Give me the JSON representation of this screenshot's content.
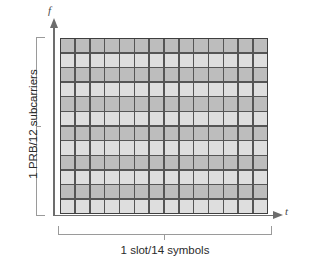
{
  "figure": {
    "type": "resource-grid-diagram",
    "background_color": "#ffffff"
  },
  "axes": {
    "vertical": {
      "label": "f",
      "name": "frequency-axis",
      "color": "#6d6d6d",
      "has_arrow": true
    },
    "horizontal": {
      "label": "t",
      "name": "time-axis",
      "color": "#6d6d6d",
      "has_arrow": true
    }
  },
  "annotations": {
    "y_bracket_label": "1 PRB/12 subcarriers",
    "x_bracket_label": "1 slot/14 symbols",
    "bracket_color": "#9a9a9a"
  },
  "chart_data": {
    "type": "heatmap",
    "title": "",
    "xlabel": "1 slot/14 symbols",
    "ylabel": "1 PRB/12 subcarriers",
    "columns": 14,
    "rows": 12,
    "column_labels": [
      "0",
      "1",
      "2",
      "3",
      "4",
      "5",
      "6",
      "7",
      "8",
      "9",
      "10",
      "11",
      "12",
      "13"
    ],
    "row_labels": [
      "11",
      "10",
      "9",
      "8",
      "7",
      "6",
      "5",
      "4",
      "3",
      "2",
      "1",
      "0"
    ],
    "grid": true,
    "legend": "none",
    "cell_shades": [
      "dark",
      "light",
      "dark",
      "light",
      "dark",
      "light",
      "dark",
      "light",
      "dark",
      "light",
      "dark",
      "light"
    ],
    "colors": {
      "shade_dark": "#bdbdbd",
      "shade_light": "#dedede",
      "gridline": "#555555",
      "border": "#3f3f3f"
    },
    "values": [
      [
        1,
        1,
        1,
        1,
        1,
        1,
        1,
        1,
        1,
        1,
        1,
        1,
        1,
        1
      ],
      [
        0,
        0,
        0,
        0,
        0,
        0,
        0,
        0,
        0,
        0,
        0,
        0,
        0,
        0
      ],
      [
        1,
        1,
        1,
        1,
        1,
        1,
        1,
        1,
        1,
        1,
        1,
        1,
        1,
        1
      ],
      [
        0,
        0,
        0,
        0,
        0,
        0,
        0,
        0,
        0,
        0,
        0,
        0,
        0,
        0
      ],
      [
        1,
        1,
        1,
        1,
        1,
        1,
        1,
        1,
        1,
        1,
        1,
        1,
        1,
        1
      ],
      [
        0,
        0,
        0,
        0,
        0,
        0,
        0,
        0,
        0,
        0,
        0,
        0,
        0,
        0
      ],
      [
        1,
        1,
        1,
        1,
        1,
        1,
        1,
        1,
        1,
        1,
        1,
        1,
        1,
        1
      ],
      [
        0,
        0,
        0,
        0,
        0,
        0,
        0,
        0,
        0,
        0,
        0,
        0,
        0,
        0
      ],
      [
        1,
        1,
        1,
        1,
        1,
        1,
        1,
        1,
        1,
        1,
        1,
        1,
        1,
        1
      ],
      [
        0,
        0,
        0,
        0,
        0,
        0,
        0,
        0,
        0,
        0,
        0,
        0,
        0,
        0
      ],
      [
        1,
        1,
        1,
        1,
        1,
        1,
        1,
        1,
        1,
        1,
        1,
        1,
        1,
        1
      ],
      [
        0,
        0,
        0,
        0,
        0,
        0,
        0,
        0,
        0,
        0,
        0,
        0,
        0,
        0
      ]
    ]
  }
}
